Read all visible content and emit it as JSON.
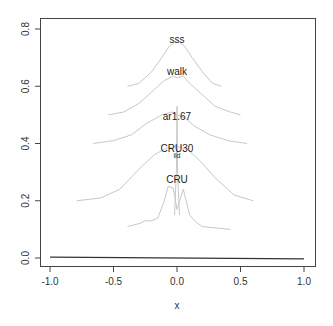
{
  "chart_data": {
    "type": "line",
    "title": "",
    "xlabel": "x",
    "ylabel": "",
    "xlim": [
      -1.05,
      1.05
    ],
    "ylim": [
      -0.02,
      0.84
    ],
    "x_ticks": [
      -1.0,
      -0.5,
      0.0,
      0.5,
      1.0
    ],
    "x_tick_labels": [
      "-1.0",
      "-0.5",
      "0.0",
      "0.5",
      "1.0"
    ],
    "y_ticks": [
      0.0,
      0.2,
      0.4,
      0.6,
      0.8
    ],
    "y_tick_labels": [
      "0.0",
      "0.2",
      "0.4",
      "0.6",
      "0.8"
    ],
    "grid": false,
    "legend": "none (curves labeled inline at peaks)",
    "baseline": {
      "x": [
        -1.0,
        1.0
      ],
      "y": [
        0.003,
        -0.003
      ],
      "color": "#333333"
    },
    "series": [
      {
        "name": "sss",
        "label_at": [
          0.0,
          0.76
        ],
        "color": "#c8c8c8",
        "x": [
          -0.39,
          -0.3,
          -0.2,
          -0.12,
          -0.06,
          0.0,
          0.06,
          0.12,
          0.2,
          0.28,
          0.35
        ],
        "y": [
          0.6,
          0.61,
          0.65,
          0.7,
          0.74,
          0.76,
          0.74,
          0.7,
          0.65,
          0.61,
          0.6
        ]
      },
      {
        "name": "walk",
        "label_at": [
          0.0,
          0.65
        ],
        "color": "#c8c8c8",
        "x": [
          -0.54,
          -0.42,
          -0.3,
          -0.2,
          -0.1,
          -0.03,
          0.0,
          0.05,
          0.1,
          0.2,
          0.3,
          0.42,
          0.5
        ],
        "y": [
          0.5,
          0.51,
          0.54,
          0.58,
          0.62,
          0.635,
          0.63,
          0.635,
          0.61,
          0.57,
          0.53,
          0.51,
          0.5
        ]
      },
      {
        "name": "ar1.67",
        "label_at": [
          0.0,
          0.49
        ],
        "color": "#c8c8c8",
        "x": [
          -0.66,
          -0.5,
          -0.36,
          -0.24,
          -0.12,
          -0.04,
          0.0,
          0.06,
          0.14,
          0.26,
          0.4,
          0.55
        ],
        "y": [
          0.4,
          0.41,
          0.43,
          0.47,
          0.5,
          0.51,
          0.5,
          0.49,
          0.46,
          0.43,
          0.41,
          0.4
        ]
      },
      {
        "name": "CRU30",
        "label_at": [
          0.0,
          0.38
        ],
        "color": "#c8c8c8",
        "x": [
          -0.79,
          -0.6,
          -0.45,
          -0.3,
          -0.18,
          -0.08,
          0.0,
          0.08,
          0.18,
          0.3,
          0.45,
          0.6
        ],
        "y": [
          0.2,
          0.21,
          0.24,
          0.31,
          0.36,
          0.385,
          0.39,
          0.38,
          0.34,
          0.28,
          0.22,
          0.2
        ]
      },
      {
        "name": "iid",
        "label_at": [
          0.0,
          0.355
        ],
        "color": "#c8c8c8",
        "x": [
          -0.02,
          -0.005,
          0.0,
          0.005,
          0.02
        ],
        "y": [
          0.15,
          0.3,
          0.53,
          0.3,
          0.15
        ]
      },
      {
        "name": "CRU",
        "label_at": [
          0.0,
          0.27
        ],
        "color": "#c8c8c8",
        "x": [
          -0.39,
          -0.3,
          -0.25,
          -0.2,
          -0.15,
          -0.1,
          -0.07,
          -0.03,
          0.0,
          0.05,
          0.1,
          0.15,
          0.2,
          0.3,
          0.42
        ],
        "y": [
          0.11,
          0.12,
          0.13,
          0.13,
          0.14,
          0.2,
          0.25,
          0.245,
          0.17,
          0.24,
          0.15,
          0.125,
          0.11,
          0.105,
          0.1
        ]
      }
    ]
  },
  "axes": {
    "xlabel": "x"
  }
}
